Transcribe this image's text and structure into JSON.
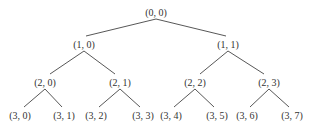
{
  "diagram": {
    "type": "binary-tree",
    "nodes": [
      {
        "id": "n00",
        "label": "(0, 0)",
        "x": 156,
        "y": 12
      },
      {
        "id": "n10",
        "label": "(1, 0)",
        "x": 84,
        "y": 44
      },
      {
        "id": "n11",
        "label": "(1, 1)",
        "x": 228,
        "y": 44
      },
      {
        "id": "n20",
        "label": "(2, 0)",
        "x": 45,
        "y": 82
      },
      {
        "id": "n21",
        "label": "(2, 1)",
        "x": 120,
        "y": 82
      },
      {
        "id": "n22",
        "label": "(2, 2)",
        "x": 195,
        "y": 82
      },
      {
        "id": "n23",
        "label": "(2, 3)",
        "x": 269,
        "y": 82
      },
      {
        "id": "n30",
        "label": "(3, 0)",
        "x": 20,
        "y": 115
      },
      {
        "id": "n31",
        "label": "(3, 1)",
        "x": 64,
        "y": 115
      },
      {
        "id": "n32",
        "label": "(3, 2)",
        "x": 96,
        "y": 115
      },
      {
        "id": "n33",
        "label": "(3, 3)",
        "x": 143,
        "y": 115
      },
      {
        "id": "n34",
        "label": "(3, 4)",
        "x": 171,
        "y": 115
      },
      {
        "id": "n35",
        "label": "(3, 5)",
        "x": 217,
        "y": 115
      },
      {
        "id": "n36",
        "label": "(3, 6)",
        "x": 247,
        "y": 115
      },
      {
        "id": "n37",
        "label": "(3, 7)",
        "x": 292,
        "y": 115
      }
    ],
    "edges": [
      [
        "n00",
        "n10"
      ],
      [
        "n00",
        "n11"
      ],
      [
        "n10",
        "n20"
      ],
      [
        "n10",
        "n21"
      ],
      [
        "n11",
        "n22"
      ],
      [
        "n11",
        "n23"
      ],
      [
        "n20",
        "n30"
      ],
      [
        "n20",
        "n31"
      ],
      [
        "n21",
        "n32"
      ],
      [
        "n21",
        "n33"
      ],
      [
        "n22",
        "n34"
      ],
      [
        "n22",
        "n35"
      ],
      [
        "n23",
        "n36"
      ],
      [
        "n23",
        "n37"
      ]
    ]
  }
}
